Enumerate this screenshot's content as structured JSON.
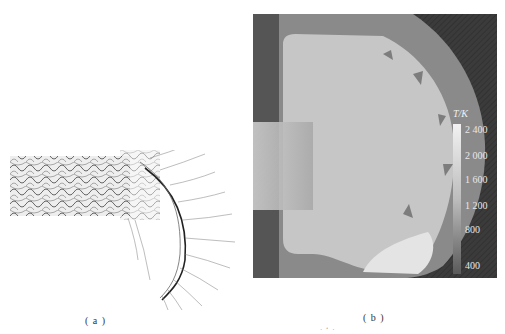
{
  "figure": {
    "panels": [
      {
        "id": "a",
        "caption": "( a )",
        "description": "numerical schlieren / density-gradient field: detonation cell pattern in straight channel turning around a corner"
      },
      {
        "id": "b",
        "caption": "( b )",
        "description": "temperature contour of detonation wave diffraction from a channel exit"
      }
    ],
    "colorbar": {
      "title": "T/K",
      "ticks": [
        "2 400",
        "2 000",
        "1 600",
        "1 200",
        "800",
        "400"
      ]
    },
    "footer_marks": "· ‘ ·"
  }
}
